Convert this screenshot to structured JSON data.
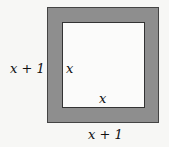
{
  "diagram": {
    "outer_square": {
      "side_label_left": "x + 1",
      "side_label_bottom": "x + 1",
      "fill": "#8e8e8e"
    },
    "inner_square": {
      "side_label_left": "x",
      "side_label_bottom": "x",
      "fill": "#fbfbfa"
    }
  }
}
